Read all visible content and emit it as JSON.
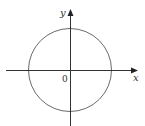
{
  "diagram": {
    "type": "circle on coordinate axes",
    "axes": {
      "x_label": "x",
      "y_label": "y",
      "origin_label": "0"
    },
    "circle": {
      "center": [
        0,
        0
      ],
      "description": "circle centered at origin"
    },
    "colors": {
      "stroke": "#555555",
      "axis": "#333333",
      "text": "#333333",
      "background": "#ffffff"
    }
  }
}
